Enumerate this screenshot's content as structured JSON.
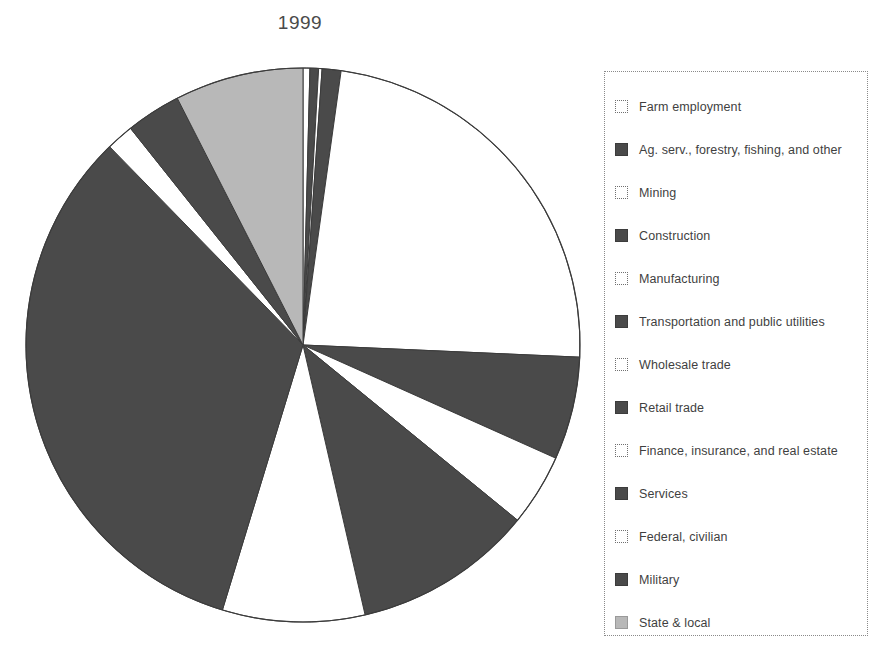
{
  "chart_data": {
    "type": "pie",
    "title": "1999",
    "xlabel": "",
    "ylabel": "",
    "legend_position": "right",
    "grid": false,
    "start_angle_deg": 0,
    "direction": "clockwise",
    "center": {
      "x": 303,
      "y": 345
    },
    "radius": 277,
    "categories": [
      "Farm employment",
      "Ag. serv., forestry, fishing, and other",
      "Mining",
      "Construction",
      "Manufacturing",
      "Transportation and public utilities",
      "Wholesale trade",
      "Retail trade",
      "Finance, insurance, and real estate",
      "Services",
      "Federal, civilian",
      "Military",
      "State & local"
    ],
    "values": [
      0.4,
      0.5,
      0.2,
      1.1,
      23.5,
      6.0,
      4.2,
      10.5,
      8.3,
      33.0,
      1.6,
      3.2,
      7.5
    ],
    "slice_colors": [
      "#ffffff",
      "#4a4a4a",
      "#ffffff",
      "#4a4a4a",
      "#ffffff",
      "#4a4a4a",
      "#ffffff",
      "#4a4a4a",
      "#ffffff",
      "#4a4a4a",
      "#ffffff",
      "#4a4a4a",
      "#b8b8b8"
    ],
    "slice_swatch_kinds": [
      "white",
      "dark",
      "white",
      "dark",
      "white",
      "dark",
      "white",
      "dark",
      "white",
      "dark",
      "white",
      "dark",
      "light"
    ]
  },
  "legend": {
    "items": [
      {
        "label": "Farm employment",
        "swatch": "white"
      },
      {
        "label": "Ag. serv., forestry, fishing, and other",
        "swatch": "dark"
      },
      {
        "label": "Mining",
        "swatch": "white"
      },
      {
        "label": "Construction",
        "swatch": "dark"
      },
      {
        "label": "Manufacturing",
        "swatch": "white"
      },
      {
        "label": "Transportation and public utilities",
        "swatch": "dark"
      },
      {
        "label": "Wholesale trade",
        "swatch": "white"
      },
      {
        "label": "Retail trade",
        "swatch": "dark"
      },
      {
        "label": "Finance, insurance, and real estate",
        "swatch": "white"
      },
      {
        "label": "Services",
        "swatch": "dark"
      },
      {
        "label": "Federal, civilian",
        "swatch": "white"
      },
      {
        "label": "Military",
        "swatch": "dark"
      },
      {
        "label": "State & local",
        "swatch": "light"
      }
    ]
  },
  "colors": {
    "slice_dark": "#4a4a4a",
    "slice_light": "#b8b8b8",
    "slice_white": "#ffffff",
    "outline": "#3c3c3c",
    "legend_border": "#8a8a8a",
    "text": "#3f3f3f"
  }
}
